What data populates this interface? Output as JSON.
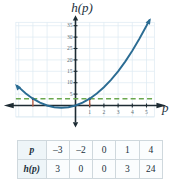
{
  "figure": {
    "y_axis_label": "h(p)",
    "x_axis_label": "p"
  },
  "chart_data": {
    "type": "line",
    "title": "",
    "xlabel": "p",
    "ylabel": "h(p)",
    "xlim": [
      -4.2,
      5.8
    ],
    "ylim": [
      -6,
      37
    ],
    "grid": true,
    "legend": "none",
    "xticks": [
      "1",
      "2",
      "3",
      "4",
      "5"
    ],
    "xtick_values": [
      1,
      2,
      3,
      4,
      5
    ],
    "yticks": [
      "5",
      "10",
      "15",
      "20",
      "25",
      "30",
      "35"
    ],
    "ytick_values": [
      5,
      10,
      15,
      20,
      25,
      30,
      35
    ],
    "curve": {
      "name": "h(p) = p^2 + 2p",
      "color": "#2b6c93",
      "arrows": [
        "start",
        "end"
      ],
      "x": [
        -4.1,
        -3.5,
        -3,
        -2.5,
        -2,
        -1.5,
        -1,
        -0.5,
        0,
        0.5,
        1,
        1.5,
        2,
        2.5,
        3,
        3.5,
        4,
        4.5,
        5,
        5.2
      ],
      "y": [
        8.61,
        5.25,
        3,
        1.25,
        0,
        -0.75,
        -1,
        -0.75,
        0,
        1.25,
        3,
        5.25,
        8,
        11.25,
        15,
        19.25,
        24,
        29.25,
        35,
        37.44
      ]
    },
    "reference_line": {
      "name": "h(p) = 3",
      "style": "dashed",
      "color": "#6aa84f",
      "y": 3,
      "x_from": -4.2,
      "x_to": 5.6
    },
    "intersection_markers": {
      "color": "#b5553c",
      "points": [
        {
          "x": -3,
          "y": 3
        },
        {
          "x": 1,
          "y": 3
        }
      ]
    },
    "annotations": []
  },
  "table": {
    "rows": [
      {
        "header": "p",
        "values": [
          "–3",
          "–2",
          "0",
          "1",
          "4"
        ]
      },
      {
        "header": "h(p)",
        "values": [
          "3",
          "0",
          "0",
          "3",
          "24"
        ]
      }
    ]
  },
  "colors": {
    "curve": "#2b6c93",
    "dashed": "#6aa84f",
    "axis": "#1d2b33",
    "grid": "#dce9f2",
    "marker": "#b5553c"
  }
}
